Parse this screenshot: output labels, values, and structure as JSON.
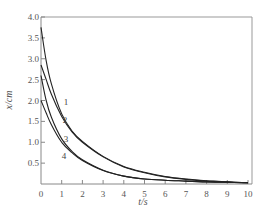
{
  "chart_data": {
    "type": "line",
    "title": "",
    "xlabel": "t/s",
    "ylabel": "x/cm",
    "xlim": [
      0,
      10
    ],
    "ylim": [
      0,
      4.0
    ],
    "grid": false,
    "legend": "inline curve labels 1-4",
    "x_ticks": [
      "0",
      "1",
      "2",
      "3",
      "4",
      "5",
      "6",
      "7",
      "8",
      "9",
      "10"
    ],
    "y_ticks": [
      "0.5",
      "1.0",
      "1.5",
      "2.0",
      "2.5",
      "3.0",
      "3.5",
      "4.0"
    ],
    "x": [
      0,
      0.25,
      0.5,
      1,
      1.5,
      2,
      3,
      4,
      5,
      6,
      7,
      8,
      9,
      10
    ],
    "series": [
      {
        "name": "1",
        "values": [
          3.75,
          2.95,
          2.4,
          1.68,
          1.27,
          1.02,
          0.66,
          0.42,
          0.28,
          0.18,
          0.12,
          0.08,
          0.05,
          0.03
        ]
      },
      {
        "name": "2",
        "values": [
          2.85,
          2.5,
          2.15,
          1.62,
          1.25,
          1.0,
          0.65,
          0.41,
          0.27,
          0.17,
          0.11,
          0.07,
          0.05,
          0.03
        ]
      },
      {
        "name": "3",
        "values": [
          2.6,
          2.0,
          1.6,
          1.08,
          0.78,
          0.58,
          0.33,
          0.19,
          0.12,
          0.09,
          0.07,
          0.05,
          0.04,
          0.03
        ]
      },
      {
        "name": "4",
        "values": [
          2.0,
          1.7,
          1.42,
          1.0,
          0.75,
          0.56,
          0.32,
          0.19,
          0.12,
          0.09,
          0.07,
          0.05,
          0.04,
          0.03
        ]
      }
    ],
    "annotations": [
      {
        "text": "1",
        "x": 1.1,
        "y": 1.9
      },
      {
        "text": "2",
        "x": 1.05,
        "y": 1.45
      },
      {
        "text": "3",
        "x": 1.1,
        "y": 1.0
      },
      {
        "text": "4",
        "x": 1.0,
        "y": 0.6
      }
    ]
  }
}
